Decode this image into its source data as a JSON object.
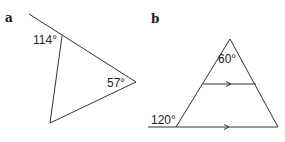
{
  "figures": [
    {
      "id": "a",
      "label": "a",
      "shape": "triangle with extended side",
      "angles": [
        {
          "value": "114°",
          "position": "exterior angle at top vertex"
        },
        {
          "value": "57°",
          "position": "interior angle at right vertex"
        }
      ]
    },
    {
      "id": "b",
      "label": "b",
      "shape": "triangle with parallel line and extended base",
      "angles": [
        {
          "value": "60°",
          "position": "interior angle at apex"
        },
        {
          "value": "120°",
          "position": "exterior angle at bottom-left vertex"
        }
      ],
      "parallel_marks": 2
    }
  ],
  "colors": {
    "line": "#333333",
    "text": "#222222",
    "background": "#ffffff"
  }
}
